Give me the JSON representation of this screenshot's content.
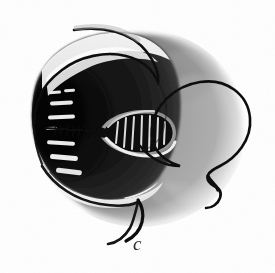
{
  "figure": {
    "label": "c",
    "label_style": "italic-lowercase",
    "medium": "halftone-print-scan",
    "domain": "scientific-illustration",
    "canvas": {
      "width": 275,
      "height": 273,
      "background": "#ffffff"
    }
  },
  "palette": {
    "background": "#ffffff",
    "ink_black": "#121212",
    "body_dark": "#2a2a2a",
    "body_mid": "#6d6d6d",
    "body_light": "#b9b9b9",
    "body_lightest": "#d8d8d8",
    "halo_white": "#f2f2f2",
    "dash_light": "#e8e8e8",
    "caption_gray": "#2b2b2b",
    "shadow_soft": "#9a9a9a"
  },
  "elements": {
    "body_mass": {
      "name": "main-body-mass",
      "description": "large rounded disc, very dark on the left grading to pale gray at the right edge",
      "center": [
        140,
        128
      ],
      "radius_x": 108,
      "radius_y": 100
    },
    "dark_cap": {
      "name": "dark-anterior-cap",
      "description": "deep black crescent covering the left two-thirds of the body",
      "center": [
        108,
        122
      ]
    },
    "capsule": {
      "name": "ribbed-capsule",
      "description": "teardrop-shaped ribbed structure at the centre, surrounded by a pale halo",
      "center": [
        128,
        132
      ],
      "width": 62,
      "height": 32,
      "rib_count": 9
    },
    "bristled_filament": {
      "name": "bristled-filament",
      "description": "thin dark shaft with short hair-like bristles extending left from the capsule",
      "from": [
        98,
        131
      ],
      "to": [
        48,
        128
      ],
      "bristle_count": 14
    },
    "lateral_dashes": {
      "name": "lateral-light-dashes",
      "description": "stack of short pale horizontal dashes on the dark left flank",
      "count": 8,
      "values": [
        {
          "x": 48,
          "y": 92,
          "w": 14,
          "h": 3
        },
        {
          "x": 62,
          "y": 90,
          "w": 11,
          "h": 3
        },
        {
          "x": 50,
          "y": 102,
          "w": 22,
          "h": 4
        },
        {
          "x": 48,
          "y": 116,
          "w": 26,
          "h": 4
        },
        {
          "x": 47,
          "y": 142,
          "w": 27,
          "h": 4
        },
        {
          "x": 50,
          "y": 156,
          "w": 27,
          "h": 5
        },
        {
          "x": 55,
          "y": 170,
          "w": 26,
          "h": 5
        },
        {
          "x": 46,
          "y": 128,
          "w": 10,
          "h": 3
        }
      ]
    },
    "top_tendril": {
      "name": "top-tendril-stroke",
      "description": "long sweeping ink line arcing over the top of the body and curving down into the left shoulder"
    },
    "right_loop": {
      "name": "right-loop-tendril",
      "description": "large open loop of line springing from the body's right side, ending in a small hooked curl"
    },
    "bottom_tendril": {
      "name": "bottom-tendril-stroke",
      "description": "line leaving the lower-left margin and tapering to a point below the body"
    },
    "inner_highlight": {
      "name": "inner-highlight-sliver",
      "description": "bright pale sliver between the dark cap and the top tendril"
    }
  }
}
